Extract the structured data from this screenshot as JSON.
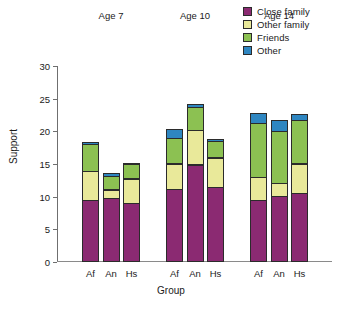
{
  "chart_data": {
    "type": "bar",
    "stacked": true,
    "title": "",
    "xlabel": "Group",
    "ylabel": "Support",
    "ylim": [
      0,
      30
    ],
    "yticks": [
      0,
      5,
      10,
      15,
      20,
      25,
      30
    ],
    "grid": false,
    "legend_position": "top-right",
    "categories": [
      "Af",
      "An",
      "Hs",
      "Af",
      "An",
      "Hs",
      "Af",
      "An",
      "Hs"
    ],
    "group_labels": [
      "Age 7",
      "Age 10",
      "Age 14"
    ],
    "groups": [
      {
        "label": "Age 7",
        "bars": [
          {
            "category": "Af",
            "close_family": 9.5,
            "other_family": 4.5,
            "friends": 4.3,
            "other": 0.4,
            "total": 18.7
          },
          {
            "category": "An",
            "close_family": 9.8,
            "other_family": 1.4,
            "friends": 2.2,
            "other": 0.6,
            "total": 14.0
          },
          {
            "category": "Hs",
            "close_family": 9.0,
            "other_family": 3.9,
            "friends": 2.3,
            "other": 0.3,
            "total": 15.5
          }
        ]
      },
      {
        "label": "Age 10",
        "bars": [
          {
            "category": "Af",
            "close_family": 11.1,
            "other_family": 4.1,
            "friends": 4.0,
            "other": 1.6,
            "total": 20.8
          },
          {
            "category": "An",
            "close_family": 14.9,
            "other_family": 5.4,
            "friends": 3.7,
            "other": 0.6,
            "total": 24.6
          },
          {
            "category": "Hs",
            "close_family": 11.5,
            "other_family": 4.6,
            "friends": 2.6,
            "other": 0.5,
            "total": 19.2
          }
        ]
      },
      {
        "label": "Age 14",
        "bars": [
          {
            "category": "Af",
            "close_family": 9.5,
            "other_family": 3.6,
            "friends": 8.4,
            "other": 1.6,
            "total": 23.1
          },
          {
            "category": "An",
            "close_family": 10.1,
            "other_family": 2.1,
            "friends": 8.1,
            "other": 1.8,
            "total": 22.1
          },
          {
            "category": "Hs",
            "close_family": 10.5,
            "other_family": 4.7,
            "friends": 6.8,
            "other": 1.1,
            "total": 23.1
          }
        ]
      }
    ],
    "series": [
      {
        "name": "Close family",
        "key": "close_family",
        "color": "#8B2A72",
        "values": [
          9.5,
          9.8,
          9.0,
          11.1,
          14.9,
          11.5,
          9.5,
          10.1,
          10.5
        ]
      },
      {
        "name": "Other family",
        "key": "other_family",
        "color": "#E9E99A",
        "values": [
          4.5,
          1.4,
          3.9,
          4.1,
          5.4,
          4.6,
          3.6,
          2.1,
          4.7
        ]
      },
      {
        "name": "Friends",
        "key": "friends",
        "color": "#8CC152",
        "values": [
          4.3,
          2.2,
          2.3,
          4.0,
          3.7,
          2.6,
          8.4,
          8.1,
          6.8
        ]
      },
      {
        "name": "Other",
        "key": "other",
        "color": "#2E86C1",
        "values": [
          0.4,
          0.6,
          0.3,
          1.6,
          0.6,
          0.5,
          1.6,
          1.8,
          1.1
        ]
      }
    ]
  }
}
